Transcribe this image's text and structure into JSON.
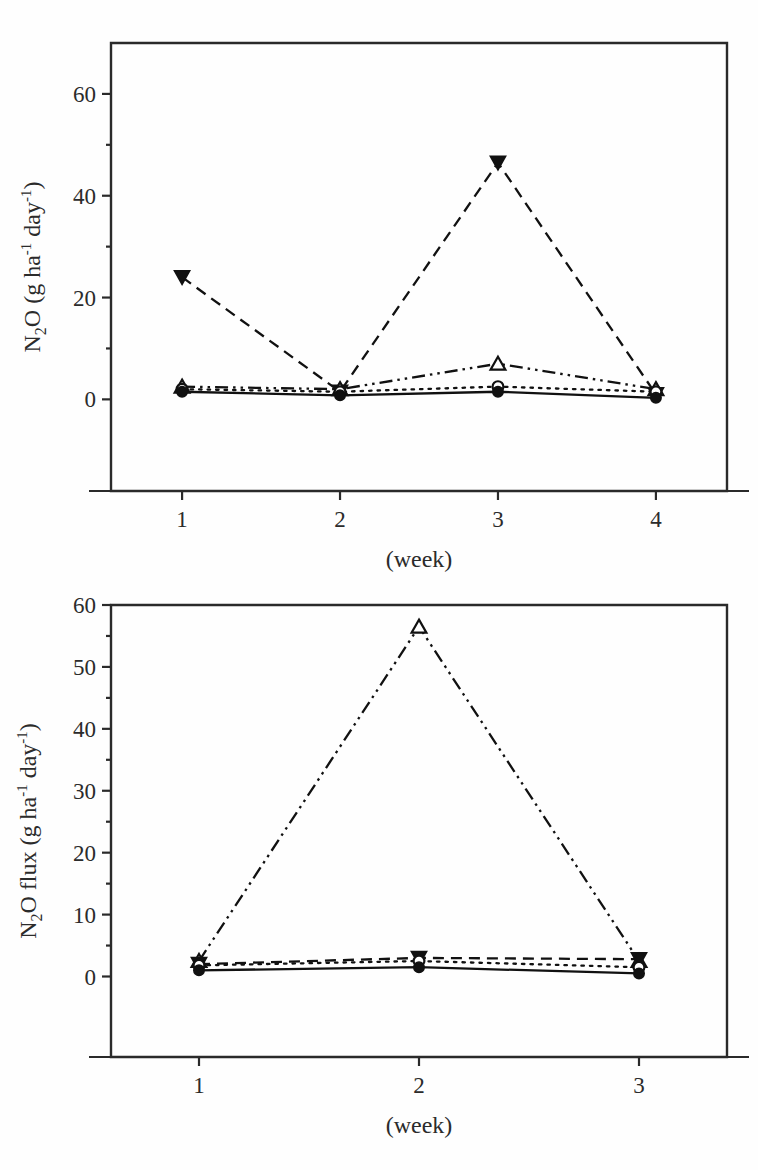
{
  "figure": {
    "panels": [
      "top",
      "bottom"
    ]
  },
  "chart_data": [
    {
      "panel": "top",
      "type": "line",
      "title": "",
      "xlabel": "(week)",
      "ylabel": "N2O (g ha-1 day-1)",
      "ylabel_parts": {
        "lead": "N",
        "sub1": "2",
        "mid": "O (g ha",
        "sup1": "-1",
        "mid2": " day",
        "sup2": "-1",
        "tail": ")"
      },
      "x": [
        1,
        2,
        3,
        4
      ],
      "xticklabels": [
        "1",
        "2",
        "3",
        "4"
      ],
      "yticks": [
        0,
        20,
        40,
        60
      ],
      "yticklabels": [
        "0",
        "20",
        "40",
        "60"
      ],
      "ylim": [
        -18,
        70
      ],
      "xlim": [
        0.55,
        4.45
      ],
      "grid": false,
      "legend": "none",
      "series": [
        {
          "name": "filled-down-triangle-dashed",
          "marker": "triangle-down-filled",
          "linestyle": "dashed",
          "values": [
            24.0,
            1.5,
            46.5,
            1.0
          ]
        },
        {
          "name": "open-up-triangle-dashdotdot",
          "marker": "triangle-up-open",
          "linestyle": "dashdotdot",
          "values": [
            2.5,
            2.0,
            7.0,
            2.0
          ]
        },
        {
          "name": "open-circle-dotted",
          "marker": "circle-open",
          "linestyle": "dotted",
          "values": [
            2.0,
            1.5,
            2.5,
            1.5
          ]
        },
        {
          "name": "filled-circle-solid",
          "marker": "circle-filled",
          "linestyle": "solid",
          "values": [
            1.5,
            0.8,
            1.5,
            0.3
          ]
        }
      ]
    },
    {
      "panel": "bottom",
      "type": "line",
      "title": "",
      "xlabel": "(week)",
      "ylabel": "N2O flux (g ha-1 day-1)",
      "ylabel_parts": {
        "lead": "N",
        "sub1": "2",
        "mid": "O flux (g ha",
        "sup1": "-1",
        "mid2": " day",
        "sup2": "-1",
        "tail": ")"
      },
      "x": [
        1,
        2,
        3
      ],
      "xticklabels": [
        "1",
        "2",
        "3"
      ],
      "yticks": [
        0,
        10,
        20,
        30,
        40,
        50,
        60
      ],
      "yticklabels": [
        "0",
        "10",
        "20",
        "30",
        "40",
        "50",
        "60"
      ],
      "ylim": [
        -13,
        60
      ],
      "xlim": [
        0.6,
        3.4
      ],
      "grid": false,
      "legend": "none",
      "series": [
        {
          "name": "open-up-triangle-dashdotdot",
          "marker": "triangle-up-open",
          "linestyle": "dashdotdot",
          "values": [
            2.5,
            56.5,
            2.5
          ]
        },
        {
          "name": "filled-down-triangle-dashed",
          "marker": "triangle-down-filled",
          "linestyle": "dashed",
          "values": [
            2.0,
            3.0,
            2.8
          ]
        },
        {
          "name": "open-circle-dotted",
          "marker": "circle-open",
          "linestyle": "dotted",
          "values": [
            1.8,
            2.5,
            1.5
          ]
        },
        {
          "name": "filled-circle-solid",
          "marker": "circle-filled",
          "linestyle": "solid",
          "values": [
            1.0,
            1.5,
            0.5
          ]
        }
      ]
    }
  ]
}
